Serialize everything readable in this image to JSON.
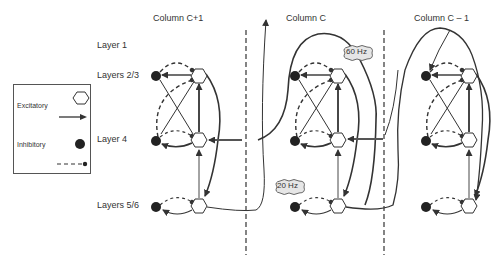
{
  "columns": [
    {
      "id": "c_plus_1",
      "title": "Column C+1"
    },
    {
      "id": "c",
      "title": "Column C"
    },
    {
      "id": "c_minus_1",
      "title": "Column C – 1"
    }
  ],
  "layers": [
    {
      "id": "l1",
      "label": "Layer 1"
    },
    {
      "id": "l23",
      "label": "Layers 2/3"
    },
    {
      "id": "l4",
      "label": "Layer 4"
    },
    {
      "id": "l56",
      "label": "Layers 5/6"
    }
  ],
  "legend": {
    "excitatory_label": "Excitatory",
    "inhibitory_label": "Inhibitory",
    "excitatory_symbol": "hexagon",
    "excitatory_connection": "solid-arrow",
    "inhibitory_symbol": "filled-circle",
    "inhibitory_connection": "dashed-line-dot"
  },
  "annotations": {
    "gamma": "60 Hz",
    "beta": "20 Hz"
  },
  "colors": {
    "line": "#333333",
    "cell_fill": "#222222",
    "cloud_fill": "#e6e6e6"
  }
}
